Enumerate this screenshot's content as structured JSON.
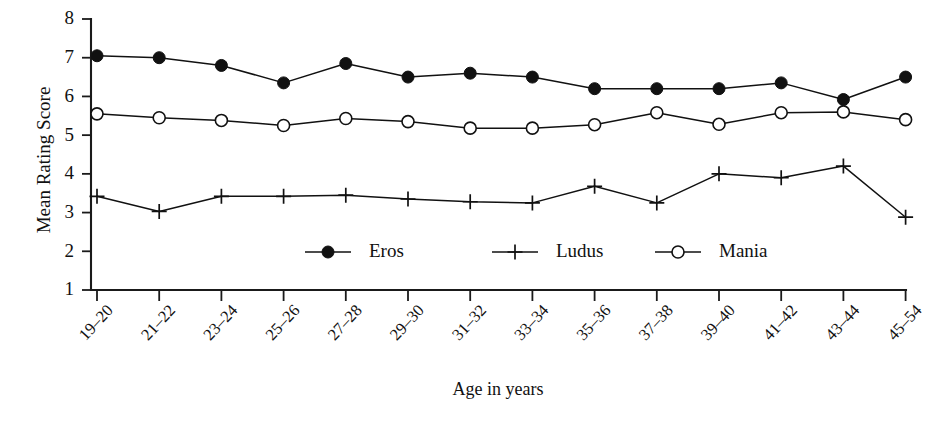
{
  "chart_data": {
    "type": "line",
    "title": "",
    "xlabel": "Age in years",
    "ylabel": "Mean Rating Score",
    "categories": [
      "19–20",
      "21–22",
      "23–24",
      "25–26",
      "27–28",
      "29–30",
      "31–32",
      "33–34",
      "35–36",
      "37–38",
      "39–40",
      "41–42",
      "43–44",
      "45–54"
    ],
    "series": [
      {
        "name": "Eros",
        "marker": "filled-circle",
        "values": [
          7.05,
          7.0,
          6.8,
          6.35,
          6.85,
          6.5,
          6.6,
          6.5,
          6.2,
          6.2,
          6.2,
          6.35,
          5.92,
          6.5
        ]
      },
      {
        "name": "Ludus",
        "marker": "plus",
        "values": [
          3.42,
          3.03,
          3.42,
          3.42,
          3.45,
          3.35,
          3.28,
          3.25,
          3.68,
          3.25,
          4.0,
          3.9,
          4.2,
          2.88
        ]
      },
      {
        "name": "Mania",
        "marker": "open-circle",
        "values": [
          5.55,
          5.45,
          5.38,
          5.25,
          5.43,
          5.35,
          5.18,
          5.18,
          5.27,
          5.58,
          5.28,
          5.58,
          5.6,
          5.4
        ]
      }
    ],
    "ylim": [
      1,
      8
    ],
    "yticks": [
      1,
      2,
      3,
      4,
      5,
      6,
      7,
      8
    ],
    "ytick_labels": [
      "1",
      "2",
      "3",
      "4",
      "5",
      "6",
      "7",
      "8"
    ],
    "grid": false,
    "legend_position": "inside-bottom-center",
    "legend_entries": [
      "Eros",
      "Ludus",
      "Mania"
    ],
    "colors": {
      "axis": "#1a1a1a",
      "line": "#111111",
      "marker_fill": "#111111",
      "marker_open_fill": "#ffffff",
      "background": "#ffffff"
    }
  }
}
